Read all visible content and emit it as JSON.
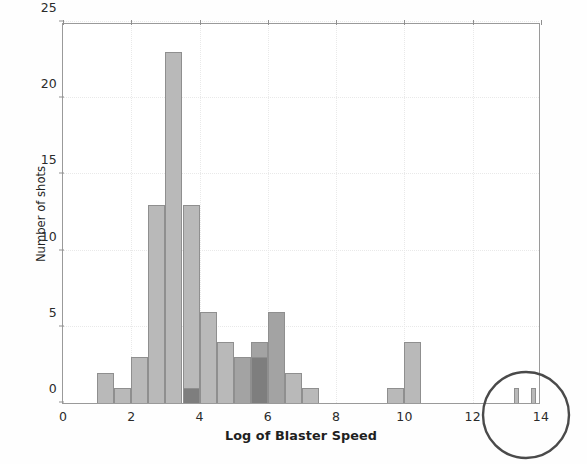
{
  "chart_data": {
    "type": "bar",
    "title": "",
    "subtitle": "",
    "xlabel": "Log of Blaster Speed",
    "ylabel": "Number of shots",
    "xlim": [
      0,
      14
    ],
    "ylim": [
      0,
      25
    ],
    "xticks": [
      0,
      2,
      4,
      6,
      8,
      10,
      12,
      14
    ],
    "yticks": [
      0,
      5,
      10,
      15,
      20,
      25
    ],
    "grid": true,
    "grid_style": "dotted",
    "legend": "none",
    "bin_width": 0.5,
    "bars": [
      {
        "x0": 1.0,
        "x1": 1.5,
        "value": 2,
        "shade": "light"
      },
      {
        "x0": 1.5,
        "x1": 2.0,
        "value": 1,
        "shade": "light"
      },
      {
        "x0": 2.0,
        "x1": 2.5,
        "value": 3,
        "shade": "light"
      },
      {
        "x0": 2.5,
        "x1": 3.0,
        "value": 13,
        "shade": "light"
      },
      {
        "x0": 3.0,
        "x1": 3.5,
        "value": 23,
        "shade": "light"
      },
      {
        "x0": 3.5,
        "x1": 4.0,
        "value": 13,
        "shade": "light"
      },
      {
        "x0": 3.5,
        "x1": 4.0,
        "value": 1,
        "shade": "dark"
      },
      {
        "x0": 4.0,
        "x1": 4.5,
        "value": 6,
        "shade": "light"
      },
      {
        "x0": 4.5,
        "x1": 5.0,
        "value": 4,
        "shade": "light"
      },
      {
        "x0": 5.0,
        "x1": 5.5,
        "value": 3,
        "shade": "medium"
      },
      {
        "x0": 5.5,
        "x1": 6.0,
        "value": 4,
        "shade": "medium"
      },
      {
        "x0": 5.5,
        "x1": 6.0,
        "value": 3,
        "shade": "dark"
      },
      {
        "x0": 6.0,
        "x1": 6.5,
        "value": 6,
        "shade": "medium"
      },
      {
        "x0": 6.5,
        "x1": 7.0,
        "value": 2,
        "shade": "light"
      },
      {
        "x0": 7.0,
        "x1": 7.5,
        "value": 1,
        "shade": "light"
      },
      {
        "x0": 9.5,
        "x1": 10.0,
        "value": 1,
        "shade": "light"
      },
      {
        "x0": 10.0,
        "x1": 10.5,
        "value": 4,
        "shade": "light"
      },
      {
        "x0": 13.2,
        "x1": 13.35,
        "value": 1,
        "shade": "light"
      },
      {
        "x0": 13.7,
        "x1": 13.85,
        "value": 1,
        "shade": "light"
      }
    ],
    "annotations": [
      {
        "kind": "hand-drawn-circle",
        "center_x": 13.55,
        "note": "circled tail bars near 13.5"
      }
    ]
  },
  "colors": {
    "bar_light": "#b9b9b9",
    "bar_medium": "#a3a3a3",
    "bar_dark": "#7e7e7e",
    "bar_edge": "#8f8f8f",
    "axis": "#9a9a9a",
    "grid": "#e9e9e9",
    "annotation": "#4a4a4a",
    "text": "#1f1f1f",
    "background": "#fefefe"
  }
}
